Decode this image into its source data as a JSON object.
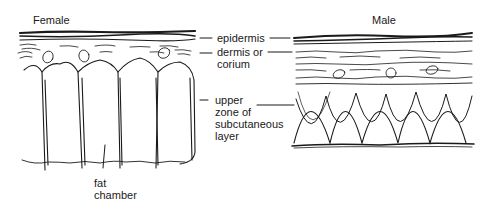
{
  "panels": {
    "female": {
      "title": "Female"
    },
    "male": {
      "title": "Male"
    }
  },
  "labels": {
    "epidermis": "epidermis",
    "dermis_line1": "dermis or",
    "dermis_line2": "corium",
    "upper_line1": "upper",
    "upper_line2": "zone of",
    "upper_line3": "subcutaneous",
    "upper_line4": "layer",
    "fat_line1": "fat",
    "fat_line2": "chamber"
  }
}
